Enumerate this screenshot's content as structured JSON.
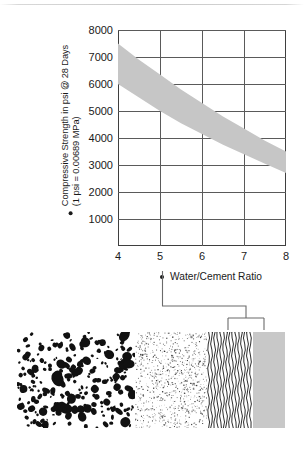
{
  "figure": {
    "chart_title": "",
    "y_axis": {
      "label_line1": "Compressive Strength in psi @ 28 Days",
      "label_line2": "(1 psi = 0.00689 MPa)",
      "bullet": "bullet-marker"
    },
    "x_axis": {
      "label": "Water/Cement Ratio",
      "bullet": "bullet-marker"
    }
  },
  "chart_data": {
    "type": "area",
    "title": "",
    "subtitle": "",
    "xlabel": "Water/Cement Ratio",
    "ylabel": "Compressive Strength in psi @ 28 Days (1 psi = 0.00689 MPa)",
    "xlim": [
      4,
      8
    ],
    "ylim": [
      0,
      8000
    ],
    "xticks": [
      "4",
      "5",
      "6",
      "7",
      "8"
    ],
    "xtick_values": [
      4,
      5,
      6,
      7,
      8
    ],
    "yticks": [
      "1000",
      "2000",
      "3000",
      "4000",
      "5000",
      "6000",
      "7000",
      "8000"
    ],
    "ytick_values": [
      1000,
      2000,
      3000,
      4000,
      5000,
      6000,
      7000,
      8000
    ],
    "grid": true,
    "legend": "none",
    "band_color": "#c6c6c6",
    "x": [
      4,
      4.5,
      5,
      5.5,
      6,
      6.5,
      7,
      7.5,
      8
    ],
    "series": [
      {
        "name": "Upper bound strength",
        "values": [
          7500,
          6900,
          6350,
          5800,
          5300,
          4800,
          4350,
          3900,
          3500
        ]
      },
      {
        "name": "Lower bound strength",
        "values": [
          6000,
          5500,
          5000,
          4550,
          4150,
          3750,
          3400,
          3050,
          2700
        ]
      }
    ],
    "annotations": [
      "Shaded band shows typical range of compressive strength versus water/cement ratio",
      "Strength decreases as water/cement ratio increases"
    ]
  },
  "specimen": {
    "zones": [
      {
        "id": "coarse-aggregate",
        "pattern": "blobs",
        "start_pct": 0,
        "width_pct": 44
      },
      {
        "id": "fine-aggregate",
        "pattern": "speckle",
        "start_pct": 44,
        "width_pct": 27
      },
      {
        "id": "water",
        "pattern": "wavy-lines",
        "start_pct": 71,
        "width_pct": 17
      },
      {
        "id": "cement",
        "pattern": "solid",
        "color": "#c8c8c8",
        "start_pct": 88,
        "width_pct": 12
      }
    ]
  },
  "connector": {
    "description": "bracket linking Water/Cement Ratio label to the water and cement zones"
  }
}
